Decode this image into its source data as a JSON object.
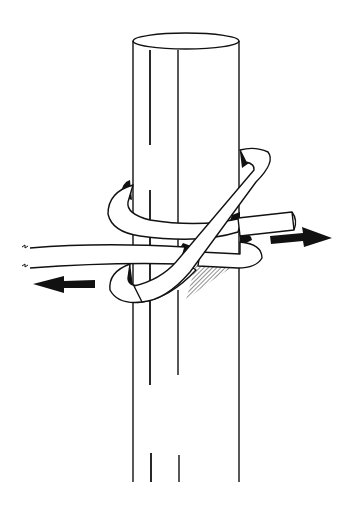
{
  "figure": {
    "elements": {
      "pole": "vertical cylindrical pole",
      "rope": "rope wrapped around pole forming a hitch",
      "arrow_right": "pull direction right",
      "arrow_left": "pull direction left",
      "rope_end": "cut rope end"
    },
    "colors": {
      "line": "#111111",
      "background": "#ffffff"
    }
  }
}
